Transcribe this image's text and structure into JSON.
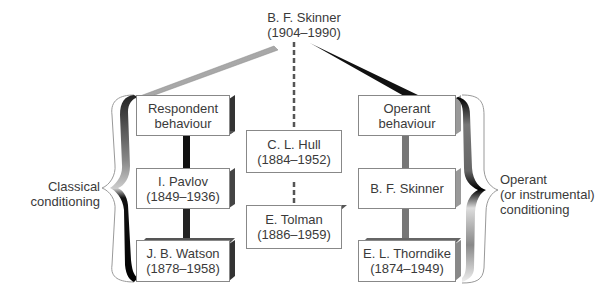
{
  "top": {
    "name": "B. F. Skinner",
    "years": "(1904–1990)"
  },
  "left_column": {
    "header": {
      "line1": "Respondent",
      "line2": "behaviour"
    },
    "items": [
      {
        "line1": "I. Pavlov",
        "line2": "(1849–1936)"
      },
      {
        "line1": "J. B. Watson",
        "line2": "(1878–1958)"
      }
    ],
    "brace_label": {
      "line1": "Classical",
      "line2": "conditioning"
    }
  },
  "center_column": {
    "items": [
      {
        "line1": "C. L. Hull",
        "line2": "(1884–1952)"
      },
      {
        "line1": "E. Tolman",
        "line2": "(1886–1959)"
      }
    ]
  },
  "right_column": {
    "header": {
      "line1": "Operant",
      "line2": "behaviour"
    },
    "items": [
      {
        "line1": "B. F. Skinner",
        "line2": ""
      },
      {
        "line1": "E. L. Thorndike",
        "line2": "(1874–1949)"
      }
    ],
    "brace_label": {
      "line1": "Operant",
      "line2": "(or instrumental)",
      "line3": "conditioning"
    }
  },
  "colors": {
    "dark": "#1a1a1a",
    "mid": "#7a7a7a",
    "light": "#b5b5b5",
    "text": "#3a3a3a"
  }
}
